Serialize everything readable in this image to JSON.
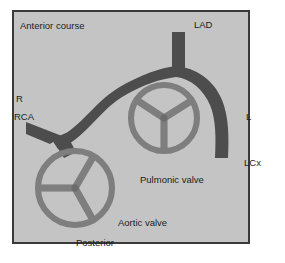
{
  "figure": {
    "type": "anatomical-schematic",
    "canvas": {
      "width": 285,
      "height": 263
    }
  },
  "colors": {
    "page_background": "#ffffff",
    "panel_background": "#c4c4c4",
    "panel_border": "#3a3a3a",
    "vessel_fill": "#4d4d4d",
    "valve_fill": "#8f8f8f",
    "valve_outline": "#5a5a5a",
    "label_text": "#1d1d1d"
  },
  "panel": {
    "x": 12,
    "y": 10,
    "width": 238,
    "height": 234,
    "border_width": 2
  },
  "labels": [
    {
      "id": "anterior-course",
      "text": "Anterior course",
      "x": 20,
      "y": 26,
      "anchor": "start"
    },
    {
      "id": "lad",
      "text": "LAD",
      "x": 194,
      "y": 25,
      "anchor": "start"
    },
    {
      "id": "r",
      "text": "R",
      "x": 16,
      "y": 99,
      "anchor": "start"
    },
    {
      "id": "rca",
      "text": "RCA",
      "x": 14,
      "y": 117,
      "anchor": "start"
    },
    {
      "id": "l",
      "text": "L",
      "x": 246,
      "y": 117,
      "anchor": "start"
    },
    {
      "id": "lcx",
      "text": "LCx",
      "x": 244,
      "y": 163,
      "anchor": "start"
    },
    {
      "id": "pulmonic-valve",
      "text": "Pulmonic valve",
      "x": 140,
      "y": 180,
      "anchor": "start"
    },
    {
      "id": "aortic-valve",
      "text": "Aortic valve",
      "x": 118,
      "y": 223,
      "anchor": "start"
    },
    {
      "id": "posterior",
      "text": "Posterior",
      "x": 76,
      "y": 243,
      "anchor": "start"
    }
  ],
  "structures": {
    "aortic_valve": {
      "name": "Aortic valve",
      "center_x": 75,
      "center_y": 188,
      "outer_radius": 40,
      "ring_thickness": 6,
      "spoke_thickness": 7,
      "spoke_angles_deg": [
        150,
        270,
        30
      ]
    },
    "pulmonic_valve": {
      "name": "Pulmonic valve",
      "center_x": 164,
      "center_y": 118,
      "outer_radius": 36,
      "ring_thickness": 6,
      "spoke_thickness": 7,
      "spoke_angles_deg": [
        210,
        330,
        90
      ]
    },
    "vessels": [
      {
        "id": "rca-trunk",
        "name": "Right coronary artery trunk",
        "description": "Short tapering stump entering from left margin to the Y junction"
      },
      {
        "id": "anterior-course-segment",
        "name": "Anterior course segment",
        "description": "S-shaped vessel running between aortic and pulmonic valves up to the left main junction"
      },
      {
        "id": "rca-to-aorta",
        "name": "RCA origin branch",
        "description": "Short branch from the Y junction down onto the aortic valve ring"
      },
      {
        "id": "lad-branch",
        "name": "Left anterior descending",
        "description": "Vertical vessel rising from the junction to the top of the panel"
      },
      {
        "id": "lcx-branch",
        "name": "Left circumflex",
        "description": "Vessel curving from the junction around the right side and ending inferiorly"
      }
    ]
  }
}
